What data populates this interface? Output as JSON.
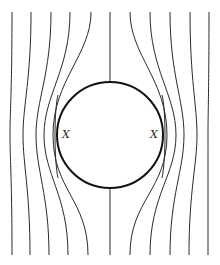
{
  "figure": {
    "labels": {
      "left": "X",
      "right": "X"
    },
    "colors": {
      "line": "#2a2a2a",
      "circle": "#111111",
      "background": "#ffffff"
    }
  }
}
